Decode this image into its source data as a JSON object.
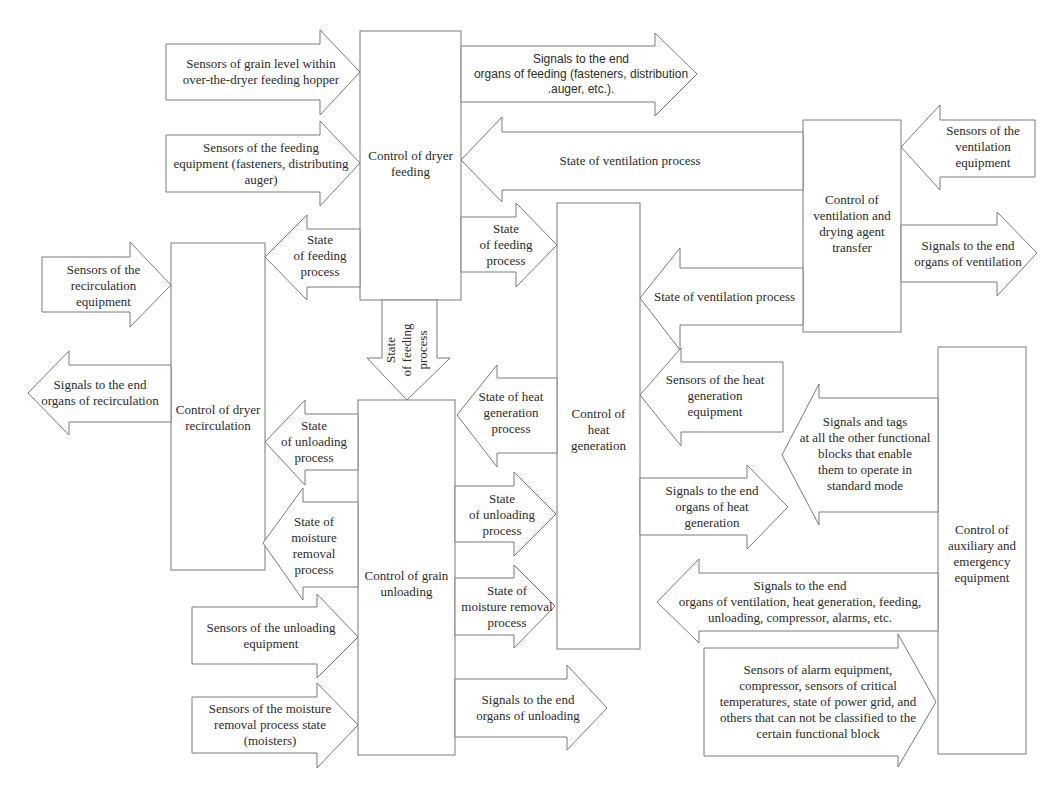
{
  "colors": {
    "stroke": "#7a7a7a",
    "text": "#2b2b2b",
    "background": "#ffffff"
  },
  "blocks": {
    "feeding": "Control of dryer\nfeeding",
    "ventilation": "Control of\nventilation and\ndrying agent\ntransfer",
    "recirculation": "Control of dryer\nrecirculation",
    "heat": "Control of\nheat\ngeneration",
    "unloading": "Control of grain\nunloading",
    "auxiliary": "Control of\nauxiliary and\nemergency\nequipment"
  },
  "arrows": {
    "sensors_grain_level": "Sensors  of grain level within\nover-the-dryer feeding hopper",
    "sensors_feeding_equipment": "Sensors of the feeding\nequipment (fasteners, distributing\nauger)",
    "signals_feeding": "Signals to the end\norgans of feeding (fasteners, distribution\n.auger, etc.).",
    "state_ventilation_to_feeding": "State of ventilation process",
    "sensors_ventilation": "Sensors of the\nventilation\nequipment",
    "signals_ventilation": "Signals to the end\norgans of ventilation",
    "state_feeding_to_recirculation": "State\nof feeding\nprocess",
    "state_feeding_to_heat": "State\nof feeding\nprocess",
    "state_ventilation_to_heat": "State of ventilation process",
    "sensors_recirculation": "Sensors of the\nrecirculation\nequipment",
    "signals_recirculation": "Signals to the end\norgans of recirculation",
    "state_feeding_to_unloading": "State\nof feeding\nprocess",
    "state_unloading_to_recirculation": "State\nof unloading\nprocess",
    "state_moisture_to_recirculation": "State of\nmoisture\nremoval\nprocess",
    "state_heat_to_unloading": "State of heat\ngeneration\nprocess",
    "sensors_heat": "Sensors of the heat\ngeneration\nequipment",
    "state_unloading_to_heat": "State\nof unloading\nprocess",
    "state_moisture_to_heat": "State of\nmoisture removal\nprocess",
    "signals_heat": "Signals to the end\norgans of heat\ngeneration",
    "signals_and_tags": "Signals and tags\nat all the other functional\nblocks that enable\nthem to operate in\nstandard mode",
    "signals_auxiliary": "Signals to the end\norgans of ventilation, heat generation, feeding,\nunloading, compressor, alarms, etc.",
    "sensors_unloading": "Sensors of the unloading\nequipment",
    "sensors_moisture": "Sensors of the moisture\nremoval process state\n(moisters)",
    "signals_unloading": "Signals to the end\norgans of unloading",
    "sensors_alarm": "Sensors of alarm equipment,\ncompressor, sensors of critical\ntemperatures, state of power grid, and\nothers that can not be classified to the\ncertain functional block"
  }
}
